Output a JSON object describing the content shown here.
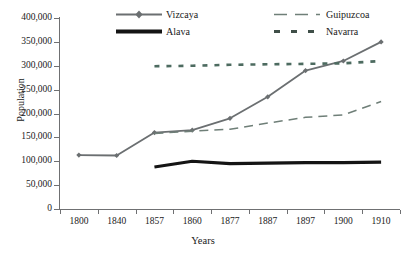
{
  "chart_data": {
    "type": "line",
    "title": "",
    "xlabel": "Years",
    "ylabel": "Population",
    "categories": [
      "1800",
      "1840",
      "1857",
      "1860",
      "1877",
      "1887",
      "1897",
      "1900",
      "1910"
    ],
    "ylim": [
      0,
      400000
    ],
    "ytick_values": [
      0,
      50000,
      100000,
      150000,
      200000,
      250000,
      300000,
      350000,
      400000
    ],
    "ytick_labels": [
      "0",
      "50,000",
      "100,000",
      "150,000",
      "200,000",
      "250,000",
      "300,000",
      "350,000",
      "400,000"
    ],
    "grid": false,
    "legend_position": "top-center",
    "series": [
      {
        "name": "Vizcaya",
        "color": "#6b6f71",
        "style": "solid-marker",
        "marker": "diamond",
        "values": [
          113000,
          112000,
          160000,
          165000,
          190000,
          235000,
          290000,
          310000,
          350000
        ]
      },
      {
        "name": "Guipuzcoa",
        "color": "#6f7f78",
        "style": "long-dash",
        "marker": "none",
        "values": [
          null,
          null,
          158000,
          163000,
          167000,
          180000,
          192000,
          197000,
          225000
        ]
      },
      {
        "name": "Alava",
        "color": "#141414",
        "style": "thick-solid",
        "marker": "none",
        "values": [
          null,
          null,
          88000,
          100000,
          95000,
          96000,
          97000,
          97000,
          98000
        ]
      },
      {
        "name": "Navarra",
        "color": "#4d6b60",
        "style": "short-dash",
        "marker": "none",
        "values": [
          null,
          null,
          299000,
          300000,
          302000,
          303000,
          304000,
          305000,
          310000
        ]
      }
    ]
  },
  "legend": {
    "vizcaya_label": "Vizcaya",
    "alava_label": "Alava",
    "guipuzcoa_label": "Guipuzcoa",
    "navarra_label": "Navarra"
  },
  "axes": {
    "y_title": "Population",
    "x_title": "Years"
  },
  "colors": {
    "axis": "#6f7072",
    "vizcaya": "#6b6f71",
    "guipuzcoa": "#6f7f78",
    "alava": "#141414",
    "navarra": "#4d6b60",
    "background": "#ffffff"
  }
}
